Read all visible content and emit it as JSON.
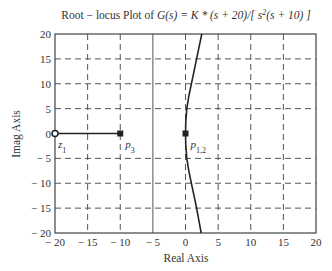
{
  "chart_data": {
    "type": "scatter",
    "title_parts": {
      "prefix": "Root − locus Plot of ",
      "func": "G(s) = K * (s + 20)/[ s",
      "sup": "2",
      "suffix": "(s + 10) ]"
    },
    "xlabel": "Real Axis",
    "ylabel": "Imag Axis",
    "xlim": [
      -20,
      20
    ],
    "ylim": [
      -20,
      20
    ],
    "xticks": [
      -20,
      -15,
      -10,
      -5,
      0,
      5,
      10,
      15,
      20
    ],
    "yticks": [
      -20,
      -15,
      -10,
      -5,
      0,
      5,
      10,
      15,
      20
    ],
    "xtick_labels": [
      "− 20",
      "− 15",
      "− 10",
      "− 5",
      "0",
      "5",
      "10",
      "15",
      "20"
    ],
    "ytick_labels": [
      "− 20",
      "− 15",
      "− 10",
      "− 5",
      "0",
      "5",
      "10",
      "15",
      "20"
    ],
    "grid": true,
    "grid_style": "dashed",
    "solid_vertical_at": -5,
    "legend": null,
    "zeros": [
      {
        "name": "z1",
        "label": "z",
        "sub": "1",
        "real": -20,
        "imag": 0
      }
    ],
    "poles": [
      {
        "name": "p3",
        "label": "p",
        "sub": "3",
        "real": -10,
        "imag": 0
      },
      {
        "name": "p1,2",
        "label": "p",
        "sub": "1,2",
        "real": 0,
        "imag": 0,
        "multiplicity": 2
      }
    ],
    "series": [
      {
        "name": "real-axis-locus",
        "x": [
          -20,
          -10
        ],
        "y": [
          0,
          0
        ]
      },
      {
        "name": "upper-branch",
        "x": [
          0,
          0.05,
          0.2,
          0.5,
          0.9,
          1.3,
          1.7,
          2.1,
          2.5
        ],
        "y": [
          0,
          2.5,
          5,
          7.5,
          10,
          12.5,
          15,
          17.5,
          20
        ]
      },
      {
        "name": "lower-branch",
        "x": [
          0,
          0.05,
          0.2,
          0.5,
          0.9,
          1.3,
          1.7,
          2.05,
          2.4
        ],
        "y": [
          0,
          -2.5,
          -5,
          -7.5,
          -10,
          -12.5,
          -15,
          -17.5,
          -20
        ]
      }
    ]
  }
}
